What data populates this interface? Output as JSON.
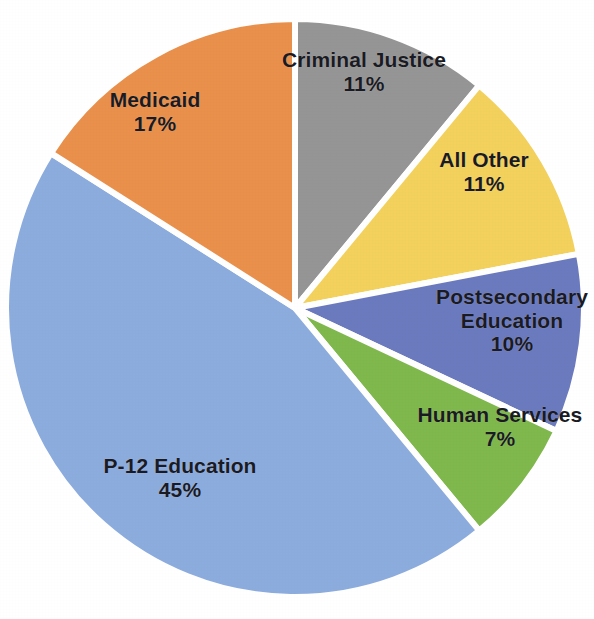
{
  "chart_data": {
    "type": "pie",
    "title": "",
    "subtitle": "",
    "xlabel": "",
    "ylabel": "",
    "legend_position": "none",
    "grid": false,
    "labels_inside_slices": true,
    "value_unit": "%",
    "total": 101,
    "categories": [
      "Criminal Justice",
      "All Other",
      "Postsecondary Education",
      "Human Services",
      "P-12 Education",
      "Medicaid"
    ],
    "values": [
      11,
      11,
      10,
      7,
      45,
      17
    ],
    "value_labels": [
      "11%",
      "11%",
      "10%",
      "7%",
      "45%",
      "17%"
    ],
    "colors": [
      "#959595",
      "#F3D15C",
      "#6B7ABE",
      "#7FB84C",
      "#8CACDE",
      "#E9904B"
    ],
    "slices": [
      {
        "name": "Criminal Justice",
        "label_lines": [
          "Criminal Justice"
        ],
        "value": 11,
        "value_label": "11%",
        "color": "#959595",
        "start_angle": 0,
        "end_angle": 39.6,
        "label_x": 364,
        "label_y": 72
      },
      {
        "name": "All Other",
        "label_lines": [
          "All Other"
        ],
        "value": 11,
        "value_label": "11%",
        "color": "#F3D15C",
        "start_angle": 39.6,
        "end_angle": 79.2,
        "label_x": 484,
        "label_y": 172
      },
      {
        "name": "Postsecondary Education",
        "label_lines": [
          "Postsecondary",
          "Education"
        ],
        "value": 10,
        "value_label": "10%",
        "color": "#6B7ABE",
        "start_angle": 79.2,
        "end_angle": 115.2,
        "label_x": 512,
        "label_y": 320
      },
      {
        "name": "Human Services",
        "label_lines": [
          "Human Services"
        ],
        "value": 7,
        "value_label": "7%",
        "color": "#7FB84C",
        "start_angle": 115.2,
        "end_angle": 140.4,
        "label_x": 500,
        "label_y": 427
      },
      {
        "name": "P-12 Education",
        "label_lines": [
          "P-12 Education"
        ],
        "value": 45,
        "value_label": "45%",
        "color": "#8CACDE",
        "start_angle": 140.4,
        "end_angle": 302.4,
        "label_x": 180,
        "label_y": 478
      },
      {
        "name": "Medicaid",
        "label_lines": [
          "Medicaid"
        ],
        "value": 17,
        "value_label": "17%",
        "color": "#E9904B",
        "start_angle": 302.4,
        "end_angle": 360,
        "label_x": 155,
        "label_y": 112
      }
    ],
    "geometry": {
      "center_x": 295,
      "center_y": 308,
      "radius": 289,
      "separator_color": "#ffffff",
      "separator_width": 6
    },
    "background_color": "#ffffff",
    "label_text_color": "#1a1a22"
  }
}
